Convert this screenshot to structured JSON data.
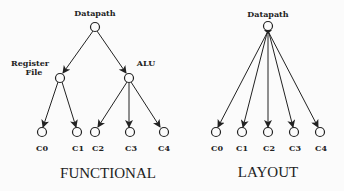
{
  "diagrams": [
    {
      "id": "functional",
      "caption": "FUNCTIONAL",
      "root": {
        "label": "Datapath"
      },
      "intermediate": [
        {
          "label": "Register File",
          "label_lines": [
            "Register",
            "File"
          ],
          "children": [
            "C0",
            "C1"
          ]
        },
        {
          "label": "ALU",
          "label_lines": [
            "ALU"
          ],
          "children": [
            "C2",
            "C3",
            "C4"
          ]
        }
      ],
      "leaves": [
        "C0",
        "C1",
        "C2",
        "C3",
        "C4"
      ]
    },
    {
      "id": "layout",
      "caption": "LAYOUT",
      "root": {
        "label": "Datapath"
      },
      "leaves": [
        "C0",
        "C1",
        "C2",
        "C3",
        "C4"
      ]
    }
  ],
  "colors": {
    "ink": "#222222",
    "background": "#fbfbfb"
  }
}
